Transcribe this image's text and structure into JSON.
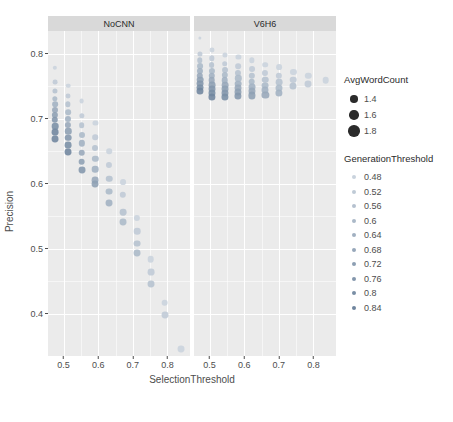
{
  "chart_data": {
    "type": "scatter",
    "title": "",
    "xlabel": "SelectionThreshold",
    "ylabel": "Precision",
    "xlim": [
      0.455,
      0.865
    ],
    "ylim": [
      0.335,
      0.835
    ],
    "x_ticks": [
      "0.5",
      "0.6",
      "0.7",
      "0.8"
    ],
    "x_tick_values": [
      0.5,
      0.6,
      0.7,
      0.8
    ],
    "y_ticks": [
      "0.8",
      "0.7",
      "0.6",
      "0.5",
      "0.4"
    ],
    "y_tick_values": [
      0.8,
      0.7,
      0.6,
      0.5,
      0.4
    ],
    "grid": true,
    "facet_variable": "Model",
    "facets": [
      {
        "label": "NoCNN",
        "points": [
          {
            "x": 0.475,
            "y": 0.778,
            "size": 1.35,
            "gen": 0.48
          },
          {
            "x": 0.475,
            "y": 0.757,
            "size": 1.45,
            "gen": 0.52
          },
          {
            "x": 0.475,
            "y": 0.743,
            "size": 1.5,
            "gen": 0.56
          },
          {
            "x": 0.475,
            "y": 0.731,
            "size": 1.55,
            "gen": 0.6
          },
          {
            "x": 0.475,
            "y": 0.722,
            "size": 1.62,
            "gen": 0.64
          },
          {
            "x": 0.475,
            "y": 0.714,
            "size": 1.68,
            "gen": 0.68
          },
          {
            "x": 0.475,
            "y": 0.706,
            "size": 1.72,
            "gen": 0.72
          },
          {
            "x": 0.475,
            "y": 0.698,
            "size": 1.76,
            "gen": 0.76
          },
          {
            "x": 0.475,
            "y": 0.689,
            "size": 1.8,
            "gen": 0.8
          },
          {
            "x": 0.475,
            "y": 0.679,
            "size": 1.84,
            "gen": 0.84
          },
          {
            "x": 0.475,
            "y": 0.669,
            "size": 1.86,
            "gen": 0.84
          },
          {
            "x": 0.513,
            "y": 0.751,
            "size": 1.4,
            "gen": 0.48
          },
          {
            "x": 0.513,
            "y": 0.735,
            "size": 1.48,
            "gen": 0.52
          },
          {
            "x": 0.513,
            "y": 0.722,
            "size": 1.55,
            "gen": 0.56
          },
          {
            "x": 0.513,
            "y": 0.71,
            "size": 1.62,
            "gen": 0.6
          },
          {
            "x": 0.513,
            "y": 0.7,
            "size": 1.68,
            "gen": 0.64
          },
          {
            "x": 0.513,
            "y": 0.691,
            "size": 1.72,
            "gen": 0.68
          },
          {
            "x": 0.513,
            "y": 0.681,
            "size": 1.76,
            "gen": 0.72
          },
          {
            "x": 0.513,
            "y": 0.671,
            "size": 1.8,
            "gen": 0.76
          },
          {
            "x": 0.513,
            "y": 0.66,
            "size": 1.84,
            "gen": 0.8
          },
          {
            "x": 0.513,
            "y": 0.649,
            "size": 1.86,
            "gen": 0.84
          },
          {
            "x": 0.552,
            "y": 0.727,
            "size": 1.45,
            "gen": 0.48
          },
          {
            "x": 0.552,
            "y": 0.705,
            "size": 1.55,
            "gen": 0.52
          },
          {
            "x": 0.552,
            "y": 0.69,
            "size": 1.62,
            "gen": 0.56
          },
          {
            "x": 0.552,
            "y": 0.675,
            "size": 1.68,
            "gen": 0.6
          },
          {
            "x": 0.552,
            "y": 0.662,
            "size": 1.74,
            "gen": 0.64
          },
          {
            "x": 0.552,
            "y": 0.648,
            "size": 1.78,
            "gen": 0.68
          },
          {
            "x": 0.552,
            "y": 0.634,
            "size": 1.82,
            "gen": 0.72
          },
          {
            "x": 0.552,
            "y": 0.621,
            "size": 1.86,
            "gen": 0.76
          },
          {
            "x": 0.592,
            "y": 0.694,
            "size": 1.5,
            "gen": 0.48
          },
          {
            "x": 0.592,
            "y": 0.672,
            "size": 1.6,
            "gen": 0.52
          },
          {
            "x": 0.592,
            "y": 0.655,
            "size": 1.68,
            "gen": 0.56
          },
          {
            "x": 0.592,
            "y": 0.638,
            "size": 1.74,
            "gen": 0.6
          },
          {
            "x": 0.592,
            "y": 0.622,
            "size": 1.8,
            "gen": 0.64
          },
          {
            "x": 0.592,
            "y": 0.606,
            "size": 1.84,
            "gen": 0.68
          },
          {
            "x": 0.592,
            "y": 0.6,
            "size": 1.86,
            "gen": 0.72
          },
          {
            "x": 0.632,
            "y": 0.65,
            "size": 1.6,
            "gen": 0.48
          },
          {
            "x": 0.632,
            "y": 0.629,
            "size": 1.7,
            "gen": 0.52
          },
          {
            "x": 0.632,
            "y": 0.608,
            "size": 1.78,
            "gen": 0.56
          },
          {
            "x": 0.632,
            "y": 0.588,
            "size": 1.84,
            "gen": 0.6
          },
          {
            "x": 0.632,
            "y": 0.57,
            "size": 1.86,
            "gen": 0.64
          },
          {
            "x": 0.671,
            "y": 0.602,
            "size": 1.65,
            "gen": 0.48
          },
          {
            "x": 0.671,
            "y": 0.583,
            "size": 1.75,
            "gen": 0.52
          },
          {
            "x": 0.671,
            "y": 0.556,
            "size": 1.82,
            "gen": 0.56
          },
          {
            "x": 0.671,
            "y": 0.541,
            "size": 1.86,
            "gen": 0.6
          },
          {
            "x": 0.712,
            "y": 0.547,
            "size": 1.72,
            "gen": 0.48
          },
          {
            "x": 0.712,
            "y": 0.527,
            "size": 1.8,
            "gen": 0.52
          },
          {
            "x": 0.712,
            "y": 0.508,
            "size": 1.84,
            "gen": 0.56
          },
          {
            "x": 0.712,
            "y": 0.494,
            "size": 1.86,
            "gen": 0.6
          },
          {
            "x": 0.752,
            "y": 0.484,
            "size": 1.8,
            "gen": 0.48
          },
          {
            "x": 0.752,
            "y": 0.464,
            "size": 1.84,
            "gen": 0.52
          },
          {
            "x": 0.752,
            "y": 0.446,
            "size": 1.86,
            "gen": 0.56
          },
          {
            "x": 0.792,
            "y": 0.417,
            "size": 1.82,
            "gen": 0.48
          },
          {
            "x": 0.792,
            "y": 0.398,
            "size": 1.86,
            "gen": 0.52
          },
          {
            "x": 0.838,
            "y": 0.346,
            "size": 1.86,
            "gen": 0.48
          }
        ]
      },
      {
        "label": "V6H6",
        "points": [
          {
            "x": 0.472,
            "y": 0.824,
            "size": 1.15,
            "gen": 0.48
          },
          {
            "x": 0.472,
            "y": 0.8,
            "size": 1.5,
            "gen": 0.52
          },
          {
            "x": 0.472,
            "y": 0.79,
            "size": 1.58,
            "gen": 0.56
          },
          {
            "x": 0.472,
            "y": 0.781,
            "size": 1.65,
            "gen": 0.6
          },
          {
            "x": 0.472,
            "y": 0.773,
            "size": 1.7,
            "gen": 0.64
          },
          {
            "x": 0.472,
            "y": 0.766,
            "size": 1.76,
            "gen": 0.68
          },
          {
            "x": 0.472,
            "y": 0.76,
            "size": 1.8,
            "gen": 0.72
          },
          {
            "x": 0.472,
            "y": 0.754,
            "size": 1.84,
            "gen": 0.76
          },
          {
            "x": 0.472,
            "y": 0.748,
            "size": 1.86,
            "gen": 0.8
          },
          {
            "x": 0.472,
            "y": 0.742,
            "size": 1.88,
            "gen": 0.84
          },
          {
            "x": 0.506,
            "y": 0.806,
            "size": 1.48,
            "gen": 0.48
          },
          {
            "x": 0.506,
            "y": 0.793,
            "size": 1.56,
            "gen": 0.52
          },
          {
            "x": 0.506,
            "y": 0.783,
            "size": 1.64,
            "gen": 0.56
          },
          {
            "x": 0.506,
            "y": 0.774,
            "size": 1.7,
            "gen": 0.6
          },
          {
            "x": 0.506,
            "y": 0.766,
            "size": 1.76,
            "gen": 0.64
          },
          {
            "x": 0.506,
            "y": 0.759,
            "size": 1.8,
            "gen": 0.68
          },
          {
            "x": 0.506,
            "y": 0.752,
            "size": 1.84,
            "gen": 0.72
          },
          {
            "x": 0.506,
            "y": 0.746,
            "size": 1.86,
            "gen": 0.76
          },
          {
            "x": 0.506,
            "y": 0.74,
            "size": 1.88,
            "gen": 0.8
          },
          {
            "x": 0.506,
            "y": 0.734,
            "size": 1.9,
            "gen": 0.84
          },
          {
            "x": 0.544,
            "y": 0.798,
            "size": 1.5,
            "gen": 0.48
          },
          {
            "x": 0.544,
            "y": 0.785,
            "size": 1.6,
            "gen": 0.52
          },
          {
            "x": 0.544,
            "y": 0.775,
            "size": 1.66,
            "gen": 0.56
          },
          {
            "x": 0.544,
            "y": 0.767,
            "size": 1.72,
            "gen": 0.6
          },
          {
            "x": 0.544,
            "y": 0.759,
            "size": 1.78,
            "gen": 0.64
          },
          {
            "x": 0.544,
            "y": 0.752,
            "size": 1.82,
            "gen": 0.68
          },
          {
            "x": 0.544,
            "y": 0.746,
            "size": 1.86,
            "gen": 0.72
          },
          {
            "x": 0.544,
            "y": 0.74,
            "size": 1.88,
            "gen": 0.76
          },
          {
            "x": 0.544,
            "y": 0.734,
            "size": 1.9,
            "gen": 0.8
          },
          {
            "x": 0.583,
            "y": 0.795,
            "size": 1.52,
            "gen": 0.48
          },
          {
            "x": 0.583,
            "y": 0.781,
            "size": 1.62,
            "gen": 0.52
          },
          {
            "x": 0.583,
            "y": 0.771,
            "size": 1.7,
            "gen": 0.56
          },
          {
            "x": 0.583,
            "y": 0.762,
            "size": 1.76,
            "gen": 0.6
          },
          {
            "x": 0.583,
            "y": 0.754,
            "size": 1.82,
            "gen": 0.64
          },
          {
            "x": 0.583,
            "y": 0.747,
            "size": 1.86,
            "gen": 0.68
          },
          {
            "x": 0.583,
            "y": 0.741,
            "size": 1.88,
            "gen": 0.72
          },
          {
            "x": 0.583,
            "y": 0.735,
            "size": 1.9,
            "gen": 0.76
          },
          {
            "x": 0.622,
            "y": 0.79,
            "size": 1.55,
            "gen": 0.48
          },
          {
            "x": 0.622,
            "y": 0.776,
            "size": 1.66,
            "gen": 0.52
          },
          {
            "x": 0.622,
            "y": 0.766,
            "size": 1.74,
            "gen": 0.56
          },
          {
            "x": 0.622,
            "y": 0.757,
            "size": 1.8,
            "gen": 0.6
          },
          {
            "x": 0.622,
            "y": 0.749,
            "size": 1.85,
            "gen": 0.64
          },
          {
            "x": 0.622,
            "y": 0.742,
            "size": 1.88,
            "gen": 0.68
          },
          {
            "x": 0.622,
            "y": 0.736,
            "size": 1.9,
            "gen": 0.72
          },
          {
            "x": 0.661,
            "y": 0.783,
            "size": 1.6,
            "gen": 0.48
          },
          {
            "x": 0.661,
            "y": 0.77,
            "size": 1.7,
            "gen": 0.52
          },
          {
            "x": 0.661,
            "y": 0.76,
            "size": 1.78,
            "gen": 0.56
          },
          {
            "x": 0.661,
            "y": 0.751,
            "size": 1.84,
            "gen": 0.6
          },
          {
            "x": 0.661,
            "y": 0.744,
            "size": 1.88,
            "gen": 0.64
          },
          {
            "x": 0.661,
            "y": 0.737,
            "size": 1.9,
            "gen": 0.68
          },
          {
            "x": 0.7,
            "y": 0.779,
            "size": 1.64,
            "gen": 0.48
          },
          {
            "x": 0.7,
            "y": 0.766,
            "size": 1.74,
            "gen": 0.52
          },
          {
            "x": 0.7,
            "y": 0.756,
            "size": 1.82,
            "gen": 0.56
          },
          {
            "x": 0.7,
            "y": 0.747,
            "size": 1.88,
            "gen": 0.6
          },
          {
            "x": 0.7,
            "y": 0.74,
            "size": 1.9,
            "gen": 0.64
          },
          {
            "x": 0.742,
            "y": 0.772,
            "size": 1.7,
            "gen": 0.48
          },
          {
            "x": 0.742,
            "y": 0.76,
            "size": 1.8,
            "gen": 0.52
          },
          {
            "x": 0.742,
            "y": 0.75,
            "size": 1.88,
            "gen": 0.56
          },
          {
            "x": 0.785,
            "y": 0.766,
            "size": 1.76,
            "gen": 0.48
          },
          {
            "x": 0.785,
            "y": 0.754,
            "size": 1.86,
            "gen": 0.52
          },
          {
            "x": 0.835,
            "y": 0.759,
            "size": 1.8,
            "gen": 0.48
          }
        ]
      }
    ],
    "legends": [
      {
        "id": "avg-word-count",
        "title": "AvgWordCount",
        "type": "size",
        "entries": [
          {
            "label": "1.4",
            "value": 1.4,
            "dot_px": 7.5,
            "color": "#2b2b2b"
          },
          {
            "label": "1.6",
            "value": 1.6,
            "dot_px": 9.5,
            "color": "#2b2b2b"
          },
          {
            "label": "1.8",
            "value": 1.8,
            "dot_px": 11.5,
            "color": "#2b2b2b"
          }
        ]
      },
      {
        "id": "generation-threshold",
        "title": "GenerationThreshold",
        "type": "color",
        "entries": [
          {
            "label": "0.48",
            "value": 0.48,
            "color": "#c9d3dd",
            "dot_px": 4
          },
          {
            "label": "0.52",
            "value": 0.52,
            "color": "#bfcad6",
            "dot_px": 4
          },
          {
            "label": "0.56",
            "value": 0.56,
            "color": "#b5c1cf",
            "dot_px": 4
          },
          {
            "label": "0.6",
            "value": 0.6,
            "color": "#abb9c8",
            "dot_px": 4
          },
          {
            "label": "0.64",
            "value": 0.64,
            "color": "#a1b0c1",
            "dot_px": 4
          },
          {
            "label": "0.68",
            "value": 0.68,
            "color": "#97a7ba",
            "dot_px": 4
          },
          {
            "label": "0.72",
            "value": 0.72,
            "color": "#8d9fb3",
            "dot_px": 4
          },
          {
            "label": "0.76",
            "value": 0.76,
            "color": "#8396ac",
            "dot_px": 4
          },
          {
            "label": "0.8",
            "value": 0.8,
            "color": "#798ea5",
            "dot_px": 4
          },
          {
            "label": "0.84",
            "value": 0.84,
            "color": "#6f859e",
            "dot_px": 4
          }
        ]
      }
    ],
    "colors": {
      "panel_background": "#ebebeb",
      "gridline": "#ffffff",
      "strip_background": "#d9d9d9",
      "point_low": "#cdd6de",
      "point_high": "#6d849d",
      "text": "#4d4d4d"
    }
  }
}
